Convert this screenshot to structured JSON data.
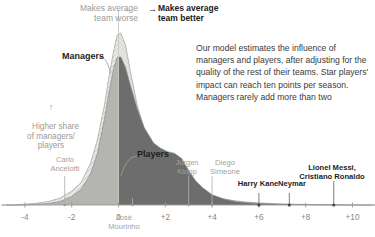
{
  "annotations": {
    "worse_arrow": "←",
    "worse_label": "Makes average\nteam worse",
    "better_arrow": "→",
    "better_label": "Makes average\nteam better",
    "y_axis_note": "Higher share\nof managers/\nplayers",
    "y_axis_arrow": "↑",
    "body_text": "Our model estimates the influence of managers and players, after adjusting for the quality of the rest of their teams. Star players' impact can reach ten points per season. Managers rarely add more than two"
  },
  "series_labels": {
    "managers": "Managers",
    "players": "Players"
  },
  "colors": {
    "managers_fill": "#e2e2e0",
    "players_fill": "#6f6f6f",
    "hatch": "#b9b9b5",
    "axis": "#9a9a95",
    "gray_text": "#a2a29d",
    "dark_text": "#1d1d1d"
  },
  "chart_data": {
    "type": "area",
    "title": "",
    "xlabel": "",
    "ylabel": "Higher share of managers/players",
    "xlim": [
      -5,
      11
    ],
    "ylim": [
      0,
      1
    ],
    "grid": false,
    "legend": "inline-labels",
    "x_ticks": [
      -4,
      -2,
      0,
      2,
      4,
      6,
      8,
      10
    ],
    "x_tick_labels": [
      "-4",
      "-2",
      "0",
      "+2",
      "+4",
      "+6",
      "+8",
      "+10"
    ],
    "series": [
      {
        "name": "Managers",
        "style": "hatched light area",
        "x": [
          -5,
          -4.5,
          -4,
          -3.5,
          -3,
          -2.5,
          -2,
          -1.6,
          -1.2,
          -0.9,
          -0.6,
          -0.4,
          -0.2,
          -0.05,
          0.1,
          0.3,
          0.5,
          0.8,
          1.1,
          1.5,
          2,
          2.5,
          3,
          3.5,
          4,
          4.5,
          5,
          5.5,
          6,
          7,
          8,
          9,
          10,
          11
        ],
        "y": [
          0.0,
          0.0,
          0.005,
          0.01,
          0.02,
          0.04,
          0.08,
          0.13,
          0.24,
          0.38,
          0.58,
          0.75,
          0.9,
          0.99,
          1.0,
          0.93,
          0.78,
          0.58,
          0.44,
          0.32,
          0.21,
          0.145,
          0.1,
          0.07,
          0.05,
          0.035,
          0.024,
          0.017,
          0.012,
          0.006,
          0.003,
          0.001,
          0.0,
          0.0
        ]
      },
      {
        "name": "Players",
        "style": "solid dark area",
        "x": [
          -5,
          -4.5,
          -4,
          -3.5,
          -3,
          -2.5,
          -2,
          -1.6,
          -1.2,
          -0.9,
          -0.6,
          -0.4,
          -0.2,
          -0.05,
          0.1,
          0.3,
          0.5,
          0.8,
          1.1,
          1.5,
          1.8,
          2.1,
          2.4,
          2.7,
          3,
          3.3,
          3.6,
          4,
          4.5,
          5,
          5.5,
          6,
          7,
          8,
          9,
          10,
          11
        ],
        "y": [
          0.0,
          0.0,
          0.0,
          0.004,
          0.008,
          0.02,
          0.05,
          0.09,
          0.18,
          0.3,
          0.5,
          0.66,
          0.8,
          0.86,
          0.86,
          0.8,
          0.7,
          0.56,
          0.45,
          0.36,
          0.33,
          0.31,
          0.3,
          0.27,
          0.2,
          0.14,
          0.1,
          0.06,
          0.035,
          0.02,
          0.013,
          0.009,
          0.004,
          0.002,
          0.001,
          0.0,
          0.0
        ]
      }
    ],
    "point_callouts": [
      {
        "label": "Carlo\nAncelotti",
        "x": -2.3,
        "emphasis": "gray",
        "group": "managers"
      },
      {
        "label": "José\nMourinho",
        "x": 0.6,
        "emphasis": "gray",
        "group": "managers"
      },
      {
        "label": "Jürgen\nKlopp",
        "x": 3.0,
        "emphasis": "gray",
        "group": "managers"
      },
      {
        "label": "Diego\nSimeone",
        "x": 4.0,
        "emphasis": "gray",
        "group": "managers"
      },
      {
        "label": "Harry Kane",
        "x": 6.0,
        "emphasis": "dark",
        "group": "players"
      },
      {
        "label": "Neymar",
        "x": 7.3,
        "emphasis": "dark",
        "group": "players"
      },
      {
        "label": "Lionel Messi,\nCristiano Ronaldo",
        "x": 9.2,
        "emphasis": "dark",
        "group": "players"
      }
    ]
  }
}
